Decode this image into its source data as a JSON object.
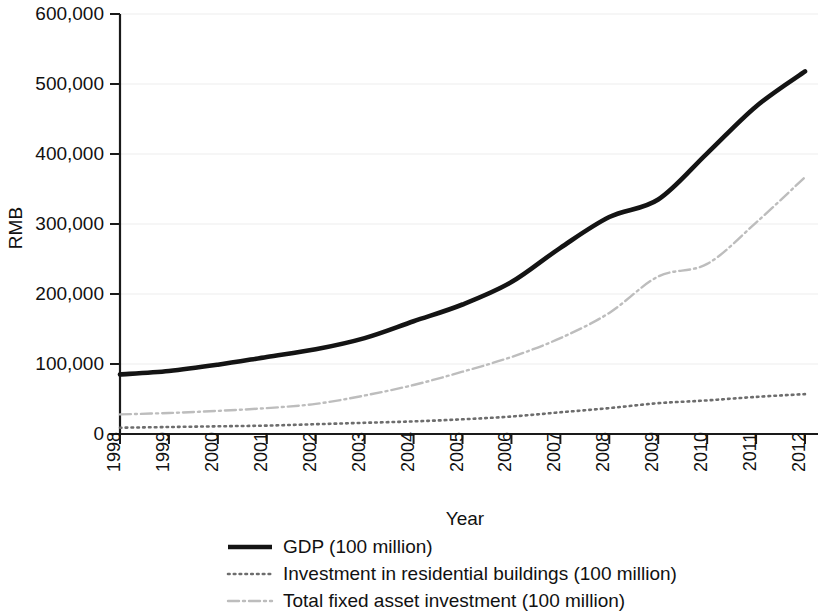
{
  "chart_data": {
    "type": "line",
    "title": "",
    "xlabel": "Year",
    "ylabel": "RMB",
    "categories": [
      "1998",
      "1999",
      "2000",
      "2001",
      "2002",
      "2003",
      "2004",
      "2005",
      "2006",
      "2007",
      "2008",
      "2009",
      "2010",
      "2011",
      "2012"
    ],
    "x": [
      1998,
      1999,
      2000,
      2001,
      2002,
      2003,
      2004,
      2005,
      2006,
      2007,
      2008,
      2009,
      2010,
      2011,
      2012
    ],
    "xlim": [
      1998,
      2012
    ],
    "ylim": [
      0,
      600000
    ],
    "yticks": [
      0,
      100000,
      200000,
      300000,
      400000,
      500000,
      600000
    ],
    "ytick_labels": [
      "0",
      "100,000",
      "200,000",
      "300,000",
      "400,000",
      "500,000",
      "600,000"
    ],
    "grid": true,
    "grid_axis": "y",
    "legend_position": "bottom",
    "series": [
      {
        "name": "GDP (100 million)",
        "style": "solid",
        "color": "#141414",
        "values": [
          85000,
          90000,
          99000,
          110000,
          121000,
          137000,
          161000,
          185000,
          217000,
          266000,
          310000,
          335000,
          401000,
          468000,
          518000
        ]
      },
      {
        "name": "Investment in residential buildings (100 million)",
        "style": "dotted",
        "color": "#6d6d6d",
        "values": [
          9000,
          10000,
          11000,
          12000,
          14000,
          16000,
          18000,
          21000,
          25000,
          31000,
          37000,
          44000,
          48000,
          53000,
          57000
        ]
      },
      {
        "name": "Total fixed asset investment (100 million)",
        "style": "dash-dot",
        "color": "#bdbdbd",
        "values": [
          28000,
          30000,
          33000,
          37000,
          43000,
          55000,
          70000,
          89000,
          110000,
          137000,
          173000,
          225000,
          243000,
          302000,
          367000
        ]
      }
    ]
  },
  "legend": {
    "items": [
      {
        "label": "GDP (100 million)"
      },
      {
        "label": "Investment in residential buildings (100 million)"
      },
      {
        "label": "Total fixed asset investment (100 million)"
      }
    ]
  }
}
